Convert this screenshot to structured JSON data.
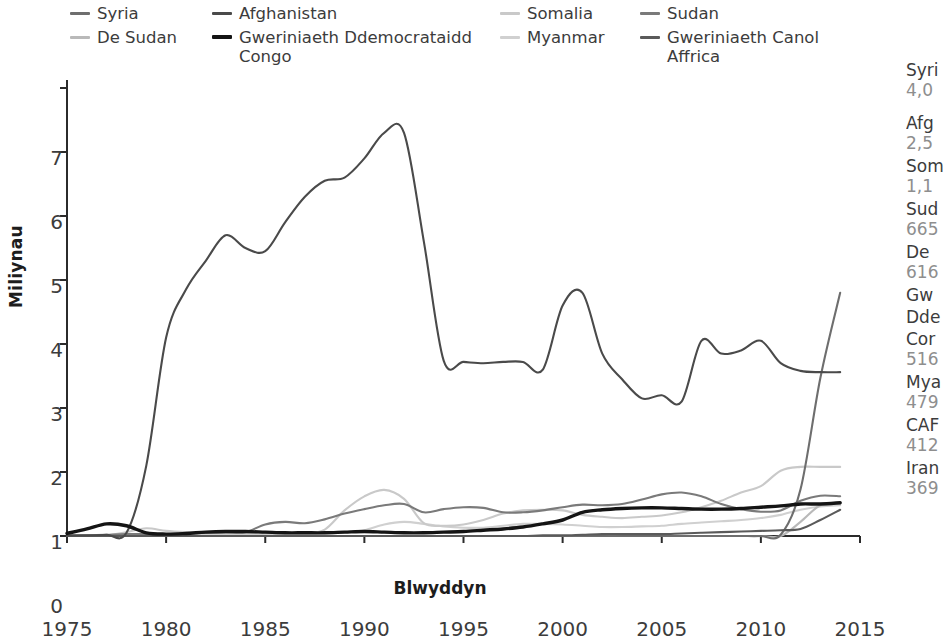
{
  "legend": {
    "items": [
      {
        "label": "Syria",
        "color": "#6e6e6e",
        "thick": false,
        "x": 70,
        "y": 4,
        "w": 130
      },
      {
        "label": "De Sudan",
        "color": "#b9b9b9",
        "thick": false,
        "x": 70,
        "y": 28,
        "w": 160
      },
      {
        "label": "Afghanistan",
        "color": "#4a4a4a",
        "thick": false,
        "x": 212,
        "y": 4,
        "w": 200
      },
      {
        "label": "Gweriniaeth Ddemocrataidd Congo",
        "color": "#141414",
        "thick": true,
        "x": 212,
        "y": 28,
        "w": 290
      },
      {
        "label": "Somalia",
        "color": "#c9c9c9",
        "thick": false,
        "x": 500,
        "y": 4,
        "w": 130
      },
      {
        "label": "Myanmar",
        "color": "#d0d0d0",
        "thick": false,
        "x": 500,
        "y": 28,
        "w": 150
      },
      {
        "label": "Sudan",
        "color": "#7a7a7a",
        "thick": false,
        "x": 640,
        "y": 4,
        "w": 130
      },
      {
        "label": "Gweriniaeth Canol Affrica",
        "color": "#5a5a5a",
        "thick": false,
        "x": 640,
        "y": 28,
        "w": 200
      }
    ]
  },
  "chart_data": {
    "type": "line",
    "title": "",
    "xlabel": "Blwyddyn",
    "ylabel": "Miliynau",
    "xlim": [
      1975,
      2015
    ],
    "ylim": [
      0,
      7
    ],
    "xticks": [
      1975,
      1980,
      1985,
      1990,
      1995,
      2000,
      2005,
      2010,
      2015
    ],
    "yticks": [
      0,
      1,
      2,
      3,
      4,
      5,
      6,
      7
    ],
    "grid": false,
    "legend_position": "top",
    "x": [
      1975,
      1976,
      1977,
      1978,
      1979,
      1980,
      1981,
      1982,
      1983,
      1984,
      1985,
      1986,
      1987,
      1988,
      1989,
      1990,
      1991,
      1992,
      1993,
      1994,
      1995,
      1996,
      1997,
      1998,
      1999,
      2000,
      2001,
      2002,
      2003,
      2004,
      2005,
      2006,
      2007,
      2008,
      2009,
      2010,
      2011,
      2012,
      2013,
      2014
    ],
    "series": [
      {
        "name": "Afghanistan",
        "color": "#4a4a4a",
        "width": 2.1,
        "values": [
          0.01,
          0.01,
          0.02,
          0.05,
          1.1,
          3.1,
          3.85,
          4.3,
          4.7,
          4.5,
          4.45,
          4.9,
          5.3,
          5.55,
          5.6,
          5.9,
          6.3,
          6.3,
          4.6,
          2.74,
          2.72,
          2.7,
          2.72,
          2.72,
          2.6,
          3.6,
          3.8,
          2.85,
          2.45,
          2.15,
          2.2,
          2.1,
          3.05,
          2.85,
          2.9,
          3.05,
          2.7,
          2.58,
          2.56,
          2.56
        ]
      },
      {
        "name": "Syria",
        "color": "#6e6e6e",
        "width": 2.1,
        "values": [
          0.0,
          0.0,
          0.0,
          0.0,
          0.0,
          0.0,
          0.0,
          0.0,
          0.0,
          0.0,
          0.0,
          0.0,
          0.0,
          0.0,
          0.0,
          0.0,
          0.0,
          0.0,
          0.0,
          0.0,
          0.0,
          0.0,
          0.0,
          0.0,
          0.0,
          0.0,
          0.0,
          0.0,
          0.0,
          0.0,
          0.0,
          0.0,
          0.0,
          0.0,
          0.0,
          0.0,
          0.02,
          0.73,
          2.47,
          3.8
        ]
      },
      {
        "name": "Sudan",
        "color": "#7a7a7a",
        "width": 2.1,
        "values": [
          0.0,
          0.01,
          0.02,
          0.03,
          0.03,
          0.03,
          0.04,
          0.05,
          0.06,
          0.06,
          0.18,
          0.22,
          0.2,
          0.26,
          0.35,
          0.42,
          0.48,
          0.5,
          0.37,
          0.42,
          0.45,
          0.44,
          0.37,
          0.37,
          0.4,
          0.45,
          0.49,
          0.48,
          0.5,
          0.57,
          0.65,
          0.68,
          0.62,
          0.5,
          0.42,
          0.38,
          0.4,
          0.55,
          0.63,
          0.62
        ]
      },
      {
        "name": "Somalia",
        "color": "#c9c9c9",
        "width": 2.1,
        "values": [
          0.0,
          0.0,
          0.01,
          0.06,
          0.12,
          0.08,
          0.06,
          0.05,
          0.04,
          0.04,
          0.04,
          0.04,
          0.04,
          0.1,
          0.4,
          0.62,
          0.72,
          0.58,
          0.2,
          0.16,
          0.18,
          0.25,
          0.35,
          0.4,
          0.41,
          0.4,
          0.33,
          0.3,
          0.28,
          0.3,
          0.32,
          0.37,
          0.45,
          0.55,
          0.68,
          0.78,
          1.02,
          1.08,
          1.08,
          1.08
        ]
      },
      {
        "name": "Gweriniaeth Ddemocrataidd Congo",
        "color": "#141414",
        "width": 3.4,
        "values": [
          0.04,
          0.11,
          0.19,
          0.16,
          0.05,
          0.03,
          0.04,
          0.06,
          0.07,
          0.07,
          0.06,
          0.05,
          0.05,
          0.05,
          0.06,
          0.07,
          0.06,
          0.05,
          0.05,
          0.06,
          0.07,
          0.09,
          0.11,
          0.14,
          0.19,
          0.25,
          0.37,
          0.41,
          0.43,
          0.44,
          0.44,
          0.43,
          0.42,
          0.42,
          0.43,
          0.45,
          0.47,
          0.5,
          0.5,
          0.52
        ]
      },
      {
        "name": "De Sudan",
        "color": "#b9b9b9",
        "width": 2.1,
        "values": [
          0.0,
          0.0,
          0.0,
          0.0,
          0.0,
          0.0,
          0.0,
          0.0,
          0.0,
          0.0,
          0.0,
          0.0,
          0.0,
          0.0,
          0.0,
          0.0,
          0.0,
          0.0,
          0.0,
          0.0,
          0.0,
          0.0,
          0.0,
          0.0,
          0.0,
          0.0,
          0.0,
          0.0,
          0.0,
          0.0,
          0.0,
          0.0,
          0.0,
          0.0,
          0.0,
          0.0,
          0.0,
          0.22,
          0.48,
          0.5
        ]
      },
      {
        "name": "Myanmar",
        "color": "#d0d0d0",
        "width": 2.1,
        "values": [
          0.0,
          0.0,
          0.0,
          0.01,
          0.02,
          0.02,
          0.02,
          0.02,
          0.03,
          0.03,
          0.03,
          0.03,
          0.03,
          0.04,
          0.06,
          0.09,
          0.18,
          0.22,
          0.19,
          0.15,
          0.13,
          0.13,
          0.16,
          0.19,
          0.19,
          0.18,
          0.16,
          0.14,
          0.14,
          0.15,
          0.16,
          0.19,
          0.21,
          0.23,
          0.25,
          0.28,
          0.33,
          0.41,
          0.46,
          0.48
        ]
      },
      {
        "name": "Gweriniaeth Canol Affrica",
        "color": "#5a5a5a",
        "width": 2.1,
        "values": [
          0.0,
          0.0,
          0.0,
          0.0,
          0.0,
          0.0,
          0.0,
          0.0,
          0.0,
          0.0,
          0.0,
          0.0,
          0.0,
          0.0,
          0.0,
          0.0,
          0.0,
          0.0,
          0.0,
          0.0,
          0.0,
          0.0,
          0.0,
          0.0,
          0.01,
          0.01,
          0.02,
          0.03,
          0.03,
          0.03,
          0.03,
          0.04,
          0.05,
          0.06,
          0.07,
          0.08,
          0.09,
          0.11,
          0.25,
          0.41
        ]
      }
    ]
  },
  "rank_panel": {
    "rows": [
      {
        "name": "Syri",
        "value": "4,0",
        "gap": false
      },
      {
        "name": "Afg",
        "value": "2,5",
        "gap": true
      },
      {
        "name": "Som",
        "value": "1,1",
        "gap": false
      },
      {
        "name": "Sud",
        "value": "665",
        "gap": false
      },
      {
        "name": "De ",
        "value": "616",
        "gap": false
      },
      {
        "name": "Gw",
        "value": "",
        "gap": false
      },
      {
        "name": "Dde",
        "value": "",
        "gap": false
      },
      {
        "name": "Cor",
        "value": "516",
        "gap": false
      },
      {
        "name": "Mya",
        "value": "479",
        "gap": false
      },
      {
        "name": "CAF",
        "value": "412",
        "gap": false
      },
      {
        "name": "Iran",
        "value": "369",
        "gap": false
      }
    ]
  }
}
